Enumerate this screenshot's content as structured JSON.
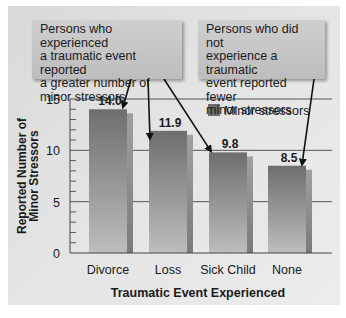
{
  "chart_data": {
    "type": "bar",
    "title": "",
    "categories": [
      "Divorce",
      "Loss",
      "Sick Child",
      "None"
    ],
    "series": [
      {
        "name": "Minor stressors",
        "values": [
          14.0,
          11.9,
          9.8,
          8.5
        ]
      }
    ],
    "data_labels": [
      "14.0",
      "11.9",
      "9.8",
      "8.5"
    ],
    "xlabel": "Traumatic Event Experienced",
    "ylabel_lines": [
      "Reported Number of",
      "Minor Stressors"
    ],
    "ylim": [
      0,
      15
    ],
    "yticks": [
      0,
      5,
      10,
      15
    ],
    "grid": true,
    "legend": {
      "placement": "top-right",
      "entries": [
        "Minor stressors"
      ]
    },
    "annotations": [
      {
        "text": "Persons who experienced a traumatic event reported a greater number of minor stressors",
        "lines": [
          "Persons who experienced",
          "a traumatic event reported",
          "a greater number of",
          "minor stressors"
        ],
        "points_to": [
          "Divorce",
          "Loss",
          "Sick Child"
        ]
      },
      {
        "text": "Persons who did not experience a traumatic event reported fewer minor stressors",
        "lines": [
          "Persons who did not",
          "experience a traumatic",
          "event reported fewer",
          "minor stressors"
        ],
        "points_to": [
          "None"
        ]
      }
    ]
  },
  "colors": {
    "bar_top": "#6e6e6e",
    "bar_bottom": "#b8b8b8",
    "bar_shadow": "#8a8a8a",
    "legend_swatch": "#6b6b6b",
    "axis": "#444444",
    "text": "#1a1a1a"
  }
}
